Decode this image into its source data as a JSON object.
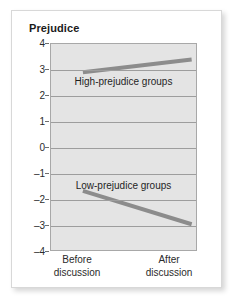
{
  "card": {
    "accent_line_color": "#8c8c8c",
    "plot_background": "#e4e4e4",
    "grid_color": "#9d9d9d"
  },
  "chart_data": {
    "type": "line",
    "title": "Prejudice",
    "xlabel": "",
    "ylabel": "Prejudice",
    "x": [
      "Before discussion",
      "After discussion"
    ],
    "categories": [
      "Before discussion",
      "After discussion"
    ],
    "xtick_labels": [
      {
        "line1": "Before",
        "line2": "discussion"
      },
      {
        "line1": "After",
        "line2": "discussion"
      }
    ],
    "ylim": [
      -4,
      4
    ],
    "ytick_labels": [
      "4",
      "3",
      "2",
      "1",
      "0",
      "–1",
      "–2",
      "–3",
      "–4"
    ],
    "ytick_values": [
      4,
      3,
      2,
      1,
      0,
      -1,
      -2,
      -3,
      -4
    ],
    "grid": true,
    "legend": "inline-annotations",
    "series": [
      {
        "name": "High-prejudice groups",
        "values": [
          2.9,
          3.4
        ],
        "color": "#8c8c8c",
        "annotation": "High-prejudice groups",
        "annotation_x": 0.5,
        "annotation_y": 2.55
      },
      {
        "name": "Low-prejudice groups",
        "values": [
          -1.7,
          -3.0
        ],
        "color": "#8c8c8c",
        "annotation": "Low-prejudice groups",
        "annotation_x": 0.5,
        "annotation_y": -1.45
      }
    ]
  }
}
